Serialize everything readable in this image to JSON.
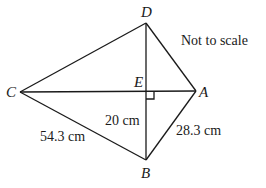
{
  "diagram": {
    "note": "Not to scale",
    "points": {
      "A": {
        "label": "A",
        "x": 196,
        "y": 91
      },
      "B": {
        "label": "B",
        "x": 146,
        "y": 160
      },
      "C": {
        "label": "C",
        "x": 20,
        "y": 92
      },
      "D": {
        "label": "D",
        "x": 146,
        "y": 23
      },
      "E": {
        "label": "E",
        "x": 146,
        "y": 91
      }
    },
    "lengths": {
      "CB": "54.3 cm",
      "EB": "20 cm",
      "AB": "28.3 cm"
    },
    "line_color": "#1a1a1a"
  }
}
